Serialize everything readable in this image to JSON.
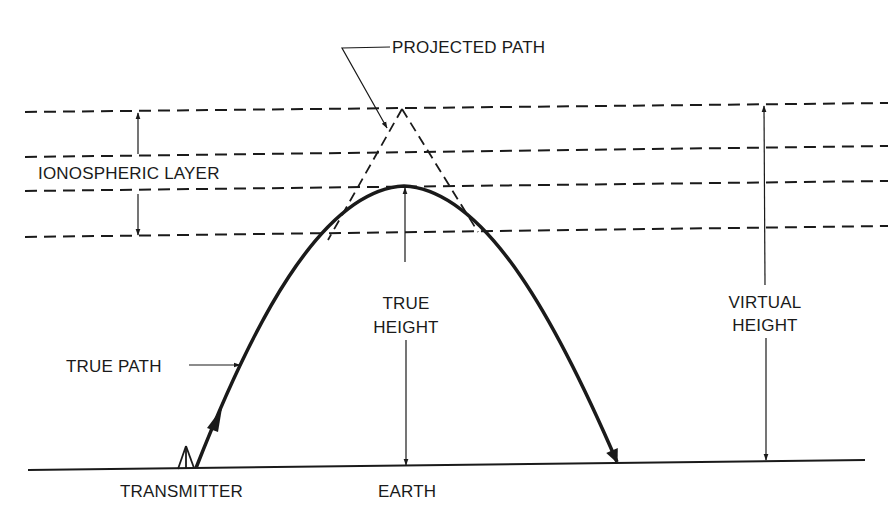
{
  "diagram": {
    "type": "ionospheric-refraction",
    "labels": {
      "projected_path": "PROJECTED PATH",
      "ionospheric_layer": "IONOSPHERIC LAYER",
      "true_height_line1": "TRUE",
      "true_height_line2": "HEIGHT",
      "virtual_height_line1": "VIRTUAL",
      "virtual_height_line2": "HEIGHT",
      "true_path": "TRUE PATH",
      "transmitter": "TRANSMITTER",
      "earth": "EARTH"
    },
    "colors": {
      "ink": "#1a1a1a",
      "background": "#ffffff"
    },
    "elements": [
      "ionospheric layer boundaries (dashed lines)",
      "projected path (dashed triangle)",
      "true path (curved arc with arrows)",
      "true height dimension arrow",
      "virtual height dimension arrow",
      "ionospheric layer thickness arrow",
      "earth surface line",
      "transmitter antenna"
    ]
  }
}
